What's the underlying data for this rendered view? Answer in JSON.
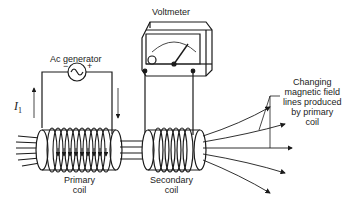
{
  "diagram": {
    "labels": {
      "voltmeter": "Voltmeter",
      "generator": "Ac generator",
      "minus": "−",
      "plus": "+",
      "current": "I",
      "current_sub": "1",
      "primary_line1": "Primary",
      "primary_line2": "coil",
      "secondary_line1": "Secondary",
      "secondary_line2": "coil",
      "field_line1": "Changing",
      "field_line2": "magnetic field",
      "field_line3": "lines produced",
      "field_line4": "by primary",
      "field_line5": "coil"
    },
    "colors": {
      "stroke": "#1a1a1a",
      "background": "#ffffff"
    }
  }
}
